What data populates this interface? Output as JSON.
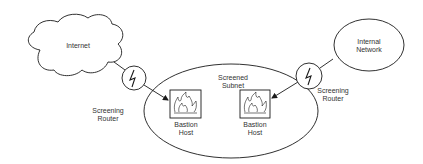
{
  "diagram": {
    "type": "network-topology",
    "internet": {
      "label": "Internet"
    },
    "internal_network": {
      "label_line1": "Internal",
      "label_line2": "Network"
    },
    "screened_subnet": {
      "label_line1": "Screened",
      "label_line2": "Subnet"
    },
    "left_router": {
      "label_line1": "Screening",
      "label_line2": "Router",
      "icon": "lightning-bolt-icon"
    },
    "right_router": {
      "label_line1": "Screening",
      "label_line2": "Router",
      "icon": "lightning-bolt-icon"
    },
    "left_bastion": {
      "label_line1": "Bastion",
      "label_line2": "Host",
      "icon": "firewall-flame-icon"
    },
    "right_bastion": {
      "label_line1": "Bastion",
      "label_line2": "Host",
      "icon": "firewall-flame-icon"
    },
    "colors": {
      "stroke": "#1a1a1a",
      "text": "#333333",
      "background": "#ffffff"
    }
  }
}
